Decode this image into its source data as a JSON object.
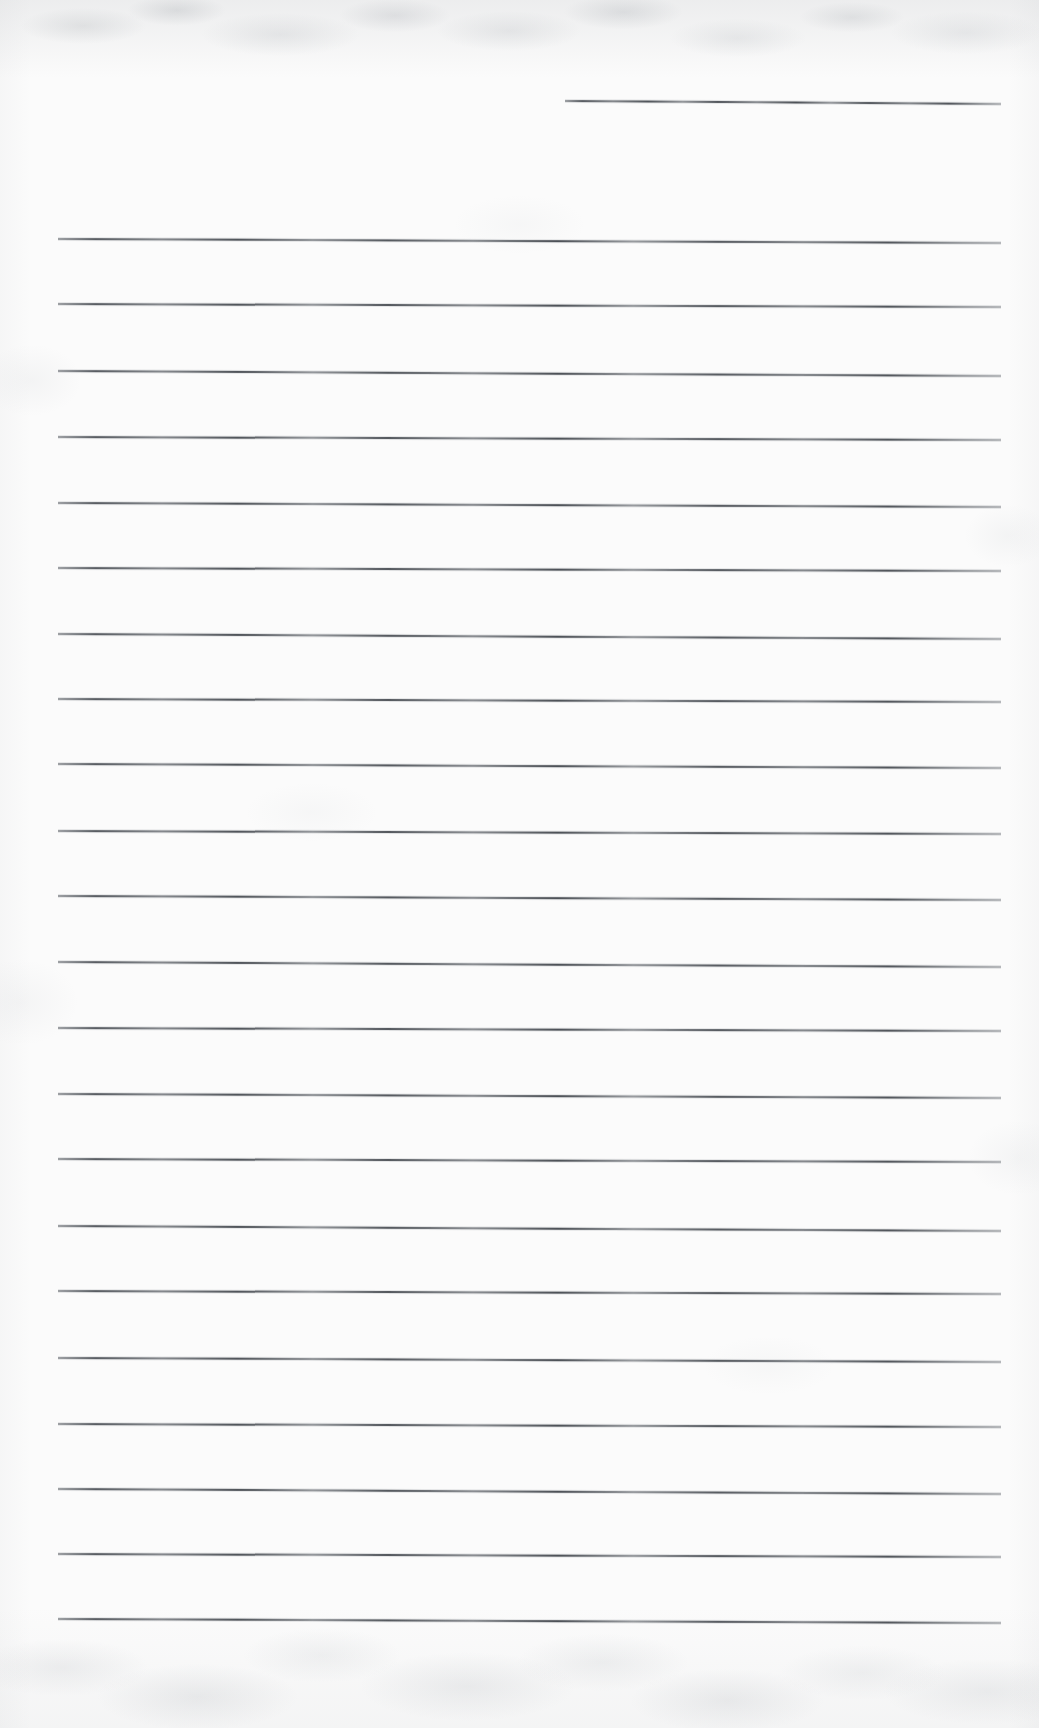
{
  "document": {
    "kind": "scanned-blank-ruled-page",
    "title": "Blank Lined Notebook Page",
    "page_width": 1039,
    "page_height": 1728,
    "paper_color": "#fbfbfb",
    "ink_color": "#4a4e54",
    "text_content": "",
    "notes": "No printed or handwritten text is present; the page contains only ruled horizontal lines.",
    "header_rule": {
      "label": "header-rule",
      "x_start": 565,
      "x_end": 1001,
      "y": 100,
      "thickness": 2,
      "slope_px": 3
    },
    "body_rules": {
      "label": "body-rules",
      "count": 21,
      "x_start": 58,
      "x_end": 1001,
      "first_y": 238,
      "spacing": 65,
      "thickness": 2,
      "lines": [
        {
          "index": 1,
          "y": 238,
          "slope_px": 4
        },
        {
          "index": 2,
          "y": 303,
          "slope_px": 3
        },
        {
          "index": 3,
          "y": 370,
          "slope_px": 5
        },
        {
          "index": 4,
          "y": 436,
          "slope_px": 3
        },
        {
          "index": 5,
          "y": 502,
          "slope_px": 4
        },
        {
          "index": 6,
          "y": 567,
          "slope_px": 3
        },
        {
          "index": 7,
          "y": 633,
          "slope_px": 5
        },
        {
          "index": 8,
          "y": 698,
          "slope_px": 3
        },
        {
          "index": 9,
          "y": 763,
          "slope_px": 4
        },
        {
          "index": 10,
          "y": 830,
          "slope_px": 3
        },
        {
          "index": 11,
          "y": 895,
          "slope_px": 4
        },
        {
          "index": 12,
          "y": 961,
          "slope_px": 5
        },
        {
          "index": 13,
          "y": 1027,
          "slope_px": 3
        },
        {
          "index": 14,
          "y": 1093,
          "slope_px": 4
        },
        {
          "index": 15,
          "y": 1158,
          "slope_px": 3
        },
        {
          "index": 16,
          "y": 1225,
          "slope_px": 5
        },
        {
          "index": 17,
          "y": 1290,
          "slope_px": 3
        },
        {
          "index": 18,
          "y": 1357,
          "slope_px": 4
        },
        {
          "index": 19,
          "y": 1423,
          "slope_px": 3
        },
        {
          "index": 20,
          "y": 1488,
          "slope_px": 5
        },
        {
          "index": 21,
          "y": 1553,
          "slope_px": 3
        },
        {
          "index": 22,
          "y": 1618,
          "slope_px": 4
        }
      ]
    },
    "bottom_margin": {
      "label": "bottom-blank-margin",
      "y_start": 1620,
      "height": 108
    }
  }
}
